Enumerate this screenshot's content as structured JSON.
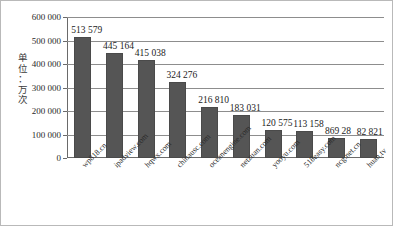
{
  "chart_data": {
    "type": "bar",
    "title": "",
    "xlabel": "",
    "ylabel": "单位：万次",
    "ylabel_chars": [
      "单",
      "位",
      "：",
      "万",
      "次"
    ],
    "ylim": [
      0,
      600000
    ],
    "yticks": [
      0,
      100000,
      200000,
      300000,
      400000,
      500000,
      600000
    ],
    "ytick_labels": [
      "0",
      "100 000",
      "200 000",
      "300 000",
      "400 000",
      "500 000",
      "600 000"
    ],
    "grid": true,
    "legend": "none",
    "categories": [
      "wp818.cn",
      "ipadview.com",
      "hqwx.com",
      "chinausc.com",
      "oceanengine.com",
      "netzuan.com",
      "yooyu.com",
      "518easy.com",
      "ncg.net.cn",
      "huan.tv"
    ],
    "values": [
      513579,
      445164,
      415038,
      324276,
      216810,
      183031,
      120575,
      113158,
      86928,
      82821
    ],
    "data_labels": [
      "513 579",
      "445 164",
      "415 038",
      "324 276",
      "216 810",
      "183 031",
      "120 575",
      "113 158",
      "869 28",
      "82 821"
    ],
    "bar_color": "#555555"
  }
}
